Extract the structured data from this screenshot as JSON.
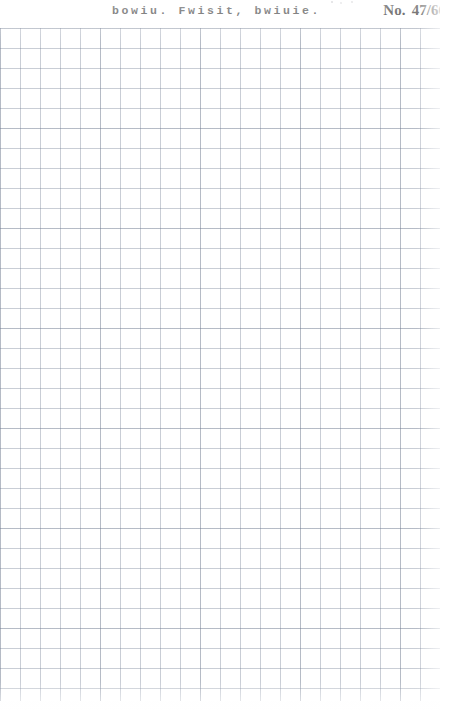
{
  "page": {
    "width": 453,
    "height": 710,
    "background_color": "#fefefe"
  },
  "header": {
    "caption": "bowiu. Fwisit, bwiuie.",
    "plate_label": "No.",
    "plate_value": "47/66",
    "caption_color": "#2b2b2b",
    "plate_color": "#242424"
  },
  "grid": {
    "cell_size_px": 20,
    "columns": 22,
    "rows": 34,
    "line_color": "#788498",
    "major_line_color": "#6e7a8e",
    "major_every": 5,
    "paper_color": "#ffffff",
    "top_offset_px": 28,
    "left_offset_px": 0,
    "width_px": 440,
    "height_px": 673
  }
}
